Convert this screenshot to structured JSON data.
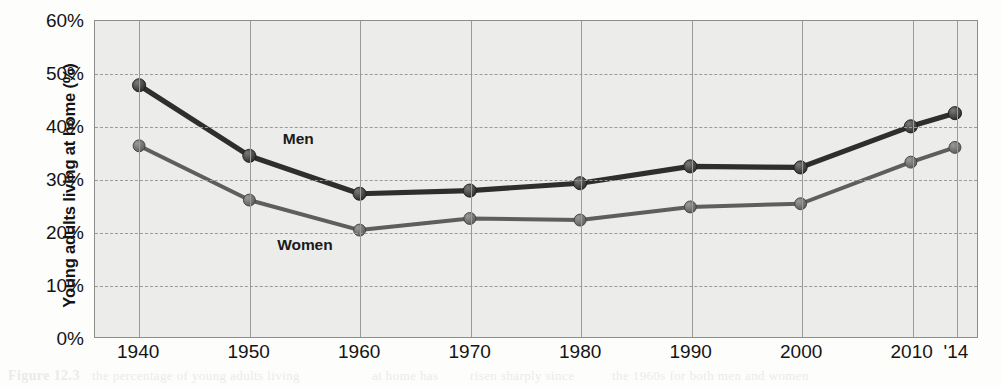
{
  "chart_data": {
    "type": "line",
    "title": "",
    "xlabel": "",
    "ylabel": "Young adults living at home (%)",
    "categories": [
      "1940",
      "1950",
      "1960",
      "1970",
      "1980",
      "1990",
      "2000",
      "2010",
      "'14"
    ],
    "x_positions": [
      1940,
      1950,
      1960,
      1970,
      1980,
      1990,
      2000,
      2010,
      2014
    ],
    "xlim": [
      1936,
      2016
    ],
    "ylim": [
      0,
      60
    ],
    "yticks": [
      0,
      10,
      20,
      30,
      40,
      50,
      60
    ],
    "ytick_labels": [
      "0%",
      "10%",
      "20%",
      "30%",
      "40%",
      "50%",
      "60%"
    ],
    "grid": true,
    "legend_position": "inline-annotation",
    "series": [
      {
        "name": "Men",
        "color": "#2e2e2e",
        "values": [
          47.8,
          34.4,
          27.2,
          27.8,
          29.2,
          32.4,
          32.2,
          40.0,
          42.5
        ]
      },
      {
        "name": "Women",
        "color": "#5e5e5e",
        "values": [
          36.3,
          26.0,
          20.3,
          22.5,
          22.2,
          24.7,
          25.3,
          33.2,
          36.0
        ]
      }
    ],
    "annotations": [
      {
        "text": "Men",
        "x": 1953.0,
        "y": 37.5
      },
      {
        "text": "Women",
        "x": 1952.5,
        "y": 17.6
      }
    ]
  },
  "colors": {
    "plot_background": "#ececeb",
    "grid": "#9a9a98",
    "axis": "#8d8d8b",
    "men_series": "#2e2e2e",
    "women_series": "#5e5e5e",
    "text": "#141414"
  },
  "bleed_text": [
    {
      "text": "Figure 12.3",
      "left": 8,
      "top": 368,
      "size": 14,
      "weight": "bold"
    },
    {
      "text": "the percentage of young adults living",
      "left": 92,
      "top": 368,
      "size": 13,
      "weight": "normal"
    },
    {
      "text": "at home has",
      "left": 372,
      "top": 368,
      "size": 13,
      "weight": "normal"
    },
    {
      "text": "risen sharply since",
      "left": 470,
      "top": 368,
      "size": 13,
      "weight": "normal"
    },
    {
      "text": "the 1960s for both men and women",
      "left": 612,
      "top": 368,
      "size": 13,
      "weight": "normal"
    },
    {
      "text": "economic conditions and delayed marriage",
      "left": 180,
      "top": 148,
      "size": 13,
      "weight": "normal"
    },
    {
      "text": "are among the principal drivers",
      "left": 600,
      "top": 148,
      "size": 13,
      "weight": "normal"
    },
    {
      "text": "share of adults ages 18 to 34",
      "left": 180,
      "top": 258,
      "size": 13,
      "weight": "normal"
    },
    {
      "text": "living in the home of a parent",
      "left": 560,
      "top": 258,
      "size": 13,
      "weight": "normal"
    },
    {
      "text": "U.S. Census Bureau data",
      "left": 640,
      "top": 206,
      "size": 12,
      "weight": "normal"
    }
  ]
}
